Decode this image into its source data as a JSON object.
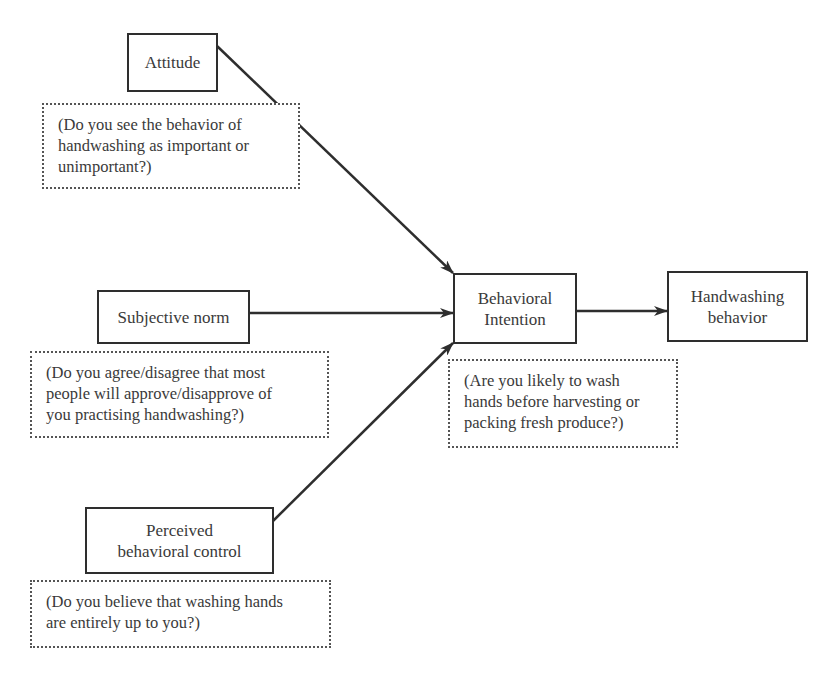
{
  "diagram": {
    "type": "theory-of-planned-behavior",
    "nodes": {
      "attitude": {
        "label": "Attitude"
      },
      "subjective_norm": {
        "label": "Subjective norm"
      },
      "perceived_control": {
        "line1": "Perceived",
        "line2": "behavioral control"
      },
      "intention": {
        "line1": "Behavioral",
        "line2": "Intention"
      },
      "behavior": {
        "line1": "Handwashing",
        "line2": "behavior"
      }
    },
    "notes": {
      "attitude": [
        "(Do you see the behavior of",
        "handwashing as important or",
        "unimportant?)"
      ],
      "subjective_norm": [
        "(Do you agree/disagree that most",
        "people will approve/disapprove of",
        "you practising handwashing?)"
      ],
      "perceived_control": [
        "(Do you believe that washing hands",
        "are entirely up to you?)"
      ],
      "intention": [
        "(Are you likely to wash",
        "hands before harvesting or",
        "packing fresh produce?)"
      ]
    },
    "edges": [
      {
        "from": "Attitude",
        "to": "Behavioral Intention"
      },
      {
        "from": "Subjective norm",
        "to": "Behavioral Intention"
      },
      {
        "from": "Perceived behavioral control",
        "to": "Behavioral Intention"
      },
      {
        "from": "Behavioral Intention",
        "to": "Handwashing behavior"
      }
    ]
  }
}
